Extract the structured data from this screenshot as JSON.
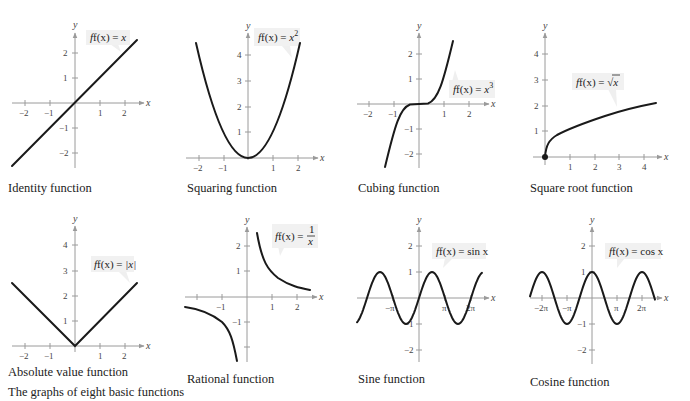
{
  "figure": {
    "caption": "The graphs of eight basic functions"
  },
  "chart_data": [
    {
      "type": "line",
      "title": "Identity function",
      "equation": "f(x) = x",
      "xlabel": "x",
      "ylabel": "y",
      "x_ticks": [
        -2,
        -1,
        1,
        2
      ],
      "y_ticks": [
        -2,
        -1,
        1,
        2
      ],
      "xlim": [
        -2.6,
        2.6
      ],
      "ylim": [
        -2.6,
        2.6
      ],
      "x": [
        -2.5,
        2.5
      ],
      "y": [
        -2.5,
        2.5
      ]
    },
    {
      "type": "line",
      "title": "Squaring function",
      "equation": "f(x) = x²",
      "xlabel": "x",
      "ylabel": "y",
      "x_ticks": [
        -2,
        -1,
        1,
        2
      ],
      "y_ticks": [
        1,
        2,
        3,
        4
      ],
      "xlim": [
        -2.5,
        2.6
      ],
      "ylim": [
        0,
        4.7
      ],
      "x": [
        -2.1,
        -1.5,
        -1,
        -0.5,
        0,
        0.5,
        1,
        1.5,
        2.1
      ],
      "y": [
        4.41,
        2.25,
        1,
        0.25,
        0,
        0.25,
        1,
        2.25,
        4.41
      ]
    },
    {
      "type": "line",
      "title": "Cubing function",
      "equation": "f(x) = x³",
      "xlabel": "x",
      "ylabel": "y",
      "x_ticks": [
        -2,
        -1,
        1,
        2
      ],
      "y_ticks": [
        -2,
        -1,
        1,
        2
      ],
      "xlim": [
        -2.5,
        2.6
      ],
      "ylim": [
        -2.6,
        2.6
      ],
      "x": [
        -1.36,
        -1,
        -0.5,
        0,
        0.5,
        1,
        1.36
      ],
      "y": [
        -2.5,
        -1,
        -0.125,
        0,
        0.125,
        1,
        2.5
      ]
    },
    {
      "type": "line",
      "title": "Square root function",
      "equation": "f(x) = √x",
      "xlabel": "x",
      "ylabel": "y",
      "x_ticks": [
        1,
        2,
        3,
        4
      ],
      "y_ticks": [
        1,
        2,
        3,
        4
      ],
      "xlim": [
        -0.5,
        4.8
      ],
      "ylim": [
        0,
        4.7
      ],
      "x": [
        0,
        0.25,
        1,
        2,
        3,
        4,
        4.5
      ],
      "y": [
        0,
        0.5,
        1,
        1.41,
        1.73,
        2,
        2.12
      ],
      "annotations": [
        "closed dot at (0, 0)"
      ]
    },
    {
      "type": "line",
      "title": "Absolute value function",
      "equation": "f(x) = |x|",
      "xlabel": "x",
      "ylabel": "y",
      "x_ticks": [
        -2,
        -1,
        1,
        2
      ],
      "y_ticks": [
        1,
        2,
        3,
        4
      ],
      "xlim": [
        -2.6,
        2.6
      ],
      "ylim": [
        0,
        4.7
      ],
      "x": [
        -2.5,
        0,
        2.5
      ],
      "y": [
        2.5,
        0,
        2.5
      ]
    },
    {
      "type": "line",
      "title": "Rational function",
      "equation": "f(x) = 1/x",
      "xlabel": "x",
      "ylabel": "y",
      "x_ticks": [
        -2,
        -1,
        1,
        2
      ],
      "y_ticks": [
        -2,
        -1,
        1,
        2
      ],
      "tick_labels_shown": {
        "x": [
          "-1",
          "1",
          "2"
        ],
        "y": [
          "2",
          "1",
          "-1"
        ]
      },
      "xlim": [
        -2.5,
        2.6
      ],
      "ylim": [
        -2.6,
        2.6
      ],
      "series": [
        {
          "name": "left branch",
          "x": [
            -2.5,
            -2,
            -1,
            -0.6,
            -0.4
          ],
          "y": [
            -0.4,
            -0.5,
            -1,
            -1.67,
            -2.5
          ]
        },
        {
          "name": "right branch",
          "x": [
            0.4,
            0.6,
            1,
            2,
            2.5
          ],
          "y": [
            2.5,
            1.67,
            1,
            0.5,
            0.4
          ]
        }
      ]
    },
    {
      "type": "line",
      "title": "Sine function",
      "equation": "f(x) = sin x",
      "xlabel": "x",
      "ylabel": "y",
      "x_ticks": [
        "-π",
        "π",
        "2π"
      ],
      "y_ticks": [
        -2,
        -1,
        1,
        2
      ],
      "xlim": [
        "-2π",
        "2.5π"
      ],
      "ylim": [
        -2.6,
        2.6
      ],
      "x_range": [
        "-3π/2 - π/2",
        "5π/2"
      ],
      "amplitude": 1,
      "period": "2π"
    },
    {
      "type": "line",
      "title": "Cosine function",
      "equation": "f(x) = cos x",
      "xlabel": "x",
      "ylabel": "y",
      "x_ticks": [
        "-2π",
        "-π",
        "π",
        "2π"
      ],
      "y_ticks": [
        -2,
        -1,
        1,
        2
      ],
      "xlim": [
        "-2.5π",
        "2.7π"
      ],
      "ylim": [
        -2.6,
        2.6
      ],
      "x_range": [
        "-5π/2",
        "5π/2"
      ],
      "amplitude": 1,
      "period": "2π"
    }
  ],
  "labels": {
    "identity": {
      "caption": "Identity function",
      "eq_lhs": "f(x) = ",
      "eq_rhs": "x"
    },
    "squaring": {
      "caption": "Squaring function",
      "eq_lhs": "f(x) = ",
      "eq_rhs": "x",
      "eq_sup": "2"
    },
    "cubing": {
      "caption": "Cubing function",
      "eq_lhs": "f(x) = ",
      "eq_rhs": "x",
      "eq_sup": "3"
    },
    "sqrt": {
      "caption": "Square root function",
      "eq_lhs": "f(x) = ",
      "eq_rhs": "x",
      "eq_radical": "√"
    },
    "abs": {
      "caption": "Absolute value function",
      "eq_lhs": "f(x) = ",
      "eq_rhs": "|x|"
    },
    "rational": {
      "caption": "Rational function",
      "eq_lhs": "f(x) = ",
      "eq_num": "1",
      "eq_den": "x"
    },
    "sine": {
      "caption": "Sine function",
      "eq_lhs": "f(x) = ",
      "eq_rhs": "sin x"
    },
    "cosine": {
      "caption": "Cosine function",
      "eq_lhs": "f(x) = ",
      "eq_rhs": "cos x"
    }
  },
  "axis_labels": {
    "x": "x",
    "y": "y"
  },
  "ticks": {
    "n2": "−2",
    "n1": "−1",
    "p1": "1",
    "p2": "2",
    "p3": "3",
    "p4": "4",
    "npi": "−π",
    "pi": "π",
    "n2pi": "−2π",
    "p2pi": "2π"
  },
  "colors": {
    "curve": "#1a1a1a",
    "axis": "#9a9a9a",
    "label_box": "#f1f1f1"
  }
}
